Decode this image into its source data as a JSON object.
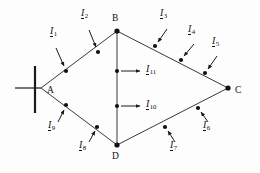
{
  "figure": {
    "kind": "electrical-ring-network-diagram",
    "background_color": "#fdfdfd",
    "line_color": "#1a1a1a",
    "text_color": "#111111"
  },
  "nodes": [
    {
      "id": "A",
      "label": "A",
      "x": 41,
      "y": 88,
      "type": "source-busbar",
      "label_x": 47,
      "label_y": 92
    },
    {
      "id": "B",
      "label": "B",
      "x": 117,
      "y": 31,
      "type": "junction",
      "label_x": 112,
      "label_y": 20
    },
    {
      "id": "C",
      "label": "C",
      "x": 228,
      "y": 88,
      "type": "junction",
      "label_x": 235,
      "label_y": 92
    },
    {
      "id": "D",
      "label": "D",
      "x": 117,
      "y": 145,
      "type": "junction",
      "label_x": 112,
      "label_y": 161
    }
  ],
  "edges": [
    {
      "from": "A",
      "to": "B"
    },
    {
      "from": "B",
      "to": "C"
    },
    {
      "from": "C",
      "to": "D"
    },
    {
      "from": "D",
      "to": "A"
    },
    {
      "from": "B",
      "to": "D"
    }
  ],
  "currents": [
    {
      "name": "I1",
      "symbol": "I",
      "subscript": "1",
      "tap_x": 66,
      "tap_y": 71,
      "label_x": 50,
      "label_y": 35,
      "arrow_from_x": 56,
      "arrow_from_y": 48,
      "arrow_to_x": 64,
      "arrow_to_y": 66
    },
    {
      "name": "I2",
      "symbol": "I",
      "subscript": "2",
      "tap_x": 98,
      "tap_y": 52,
      "label_x": 81,
      "label_y": 17,
      "arrow_from_x": 89,
      "arrow_from_y": 30,
      "arrow_to_x": 96,
      "arrow_to_y": 47
    },
    {
      "name": "I3",
      "symbol": "I",
      "subscript": "3",
      "tap_x": 155,
      "tap_y": 46,
      "label_x": 163,
      "label_y": 17,
      "arrow_from_x": 167,
      "arrow_from_y": 29,
      "arrow_to_x": 158,
      "arrow_to_y": 42
    },
    {
      "name": "I4",
      "symbol": "I",
      "subscript": "4",
      "tap_x": 181,
      "tap_y": 60,
      "label_x": 191,
      "label_y": 33,
      "arrow_from_x": 194,
      "arrow_from_y": 44,
      "arrow_to_x": 184,
      "arrow_to_y": 56
    },
    {
      "name": "I5",
      "symbol": "I",
      "subscript": "5",
      "tap_x": 205,
      "tap_y": 73,
      "label_x": 214,
      "label_y": 44,
      "arrow_from_x": 217,
      "arrow_from_y": 56,
      "arrow_to_x": 208,
      "arrow_to_y": 69
    },
    {
      "name": "I6",
      "symbol": "I",
      "subscript": "6",
      "tap_x": 198,
      "tap_y": 108,
      "label_x": 205,
      "label_y": 127,
      "arrow_from_x": 208,
      "arrow_from_y": 122,
      "arrow_to_x": 201,
      "arrow_to_y": 112
    },
    {
      "name": "I7",
      "symbol": "I",
      "subscript": "7",
      "tap_x": 165,
      "tap_y": 127,
      "label_x": 172,
      "label_y": 147,
      "arrow_from_x": 175,
      "arrow_from_y": 142,
      "arrow_to_x": 168,
      "arrow_to_y": 131
    },
    {
      "name": "I8",
      "symbol": "I",
      "subscript": "8",
      "tap_x": 97,
      "tap_y": 127,
      "label_x": 82,
      "label_y": 147,
      "arrow_from_x": 89,
      "arrow_from_y": 142,
      "arrow_to_x": 95,
      "arrow_to_y": 131
    },
    {
      "name": "I9",
      "symbol": "I",
      "subscript": "9",
      "tap_x": 66,
      "tap_y": 105,
      "label_x": 51,
      "label_y": 127,
      "arrow_from_x": 58,
      "arrow_from_y": 122,
      "arrow_to_x": 64,
      "arrow_to_y": 110
    },
    {
      "name": "I10",
      "symbol": "I",
      "subscript": "10",
      "tap_x": 117,
      "tap_y": 106,
      "label_x": 154,
      "label_y": 100,
      "arrow_from_x": 121,
      "arrow_from_y": 106,
      "arrow_to_x": 140,
      "arrow_to_y": 106
    },
    {
      "name": "I11",
      "symbol": "I",
      "subscript": "11",
      "tap_x": 117,
      "tap_y": 71,
      "label_x": 154,
      "label_y": 65,
      "arrow_from_x": 121,
      "arrow_from_y": 71,
      "arrow_to_x": 140,
      "arrow_to_y": 71
    }
  ],
  "source_symbol": {
    "name": "infeed-busbar",
    "bar_x": 35,
    "bar_top": 66,
    "bar_bottom": 113,
    "lead_x1": 15,
    "lead_x2": 41,
    "lead_y": 88
  }
}
